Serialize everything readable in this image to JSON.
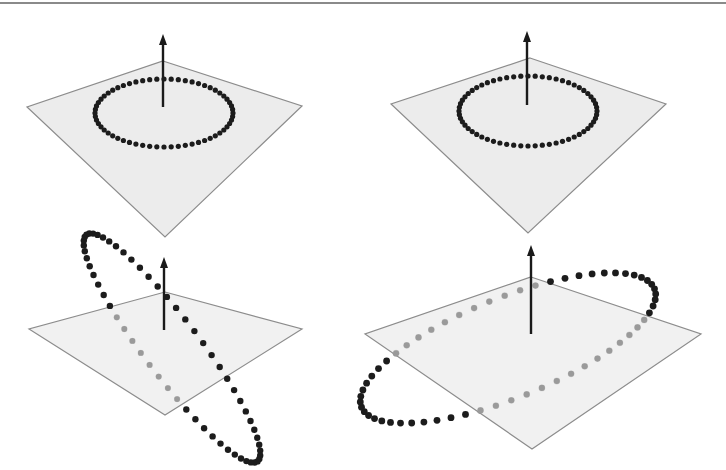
{
  "figure": {
    "colors": {
      "background": "#ffffff",
      "plane_fill": "#ececec",
      "plane_edge": "#8c8c8c",
      "arrow": "#1a1a1a",
      "dot_above": "#1c1c1c",
      "dot_below": "#9a9a9a"
    },
    "panels": [
      {
        "id": "top-left",
        "plane": [
          [
            163,
            61
          ],
          [
            302,
            106
          ],
          [
            165,
            237
          ],
          [
            27,
            107
          ]
        ],
        "arrow": {
          "from": [
            163,
            107
          ],
          "to": [
            163,
            34
          ]
        },
        "ring": {
          "cx": 164,
          "cy": 113,
          "rx": 69,
          "ry": 34,
          "tilt": 0,
          "count": 60,
          "dot_r": 2.6,
          "mode": "flat"
        }
      },
      {
        "id": "top-right",
        "plane": [
          [
            530,
            58
          ],
          [
            666,
            104
          ],
          [
            528,
            233
          ],
          [
            391,
            104
          ]
        ],
        "arrow": {
          "from": [
            527,
            105
          ],
          "to": [
            527,
            31
          ]
        },
        "ring": {
          "cx": 528,
          "cy": 111,
          "rx": 69,
          "ry": 35,
          "tilt": 0,
          "count": 60,
          "dot_r": 2.6,
          "mode": "flat"
        }
      },
      {
        "id": "bottom-left",
        "plane": [
          [
            165,
            292
          ],
          [
            302,
            329
          ],
          [
            165,
            415
          ],
          [
            29,
            329
          ]
        ],
        "arrow": {
          "from": [
            164,
            330
          ],
          "to": [
            164,
            257
          ]
        },
        "ring": {
          "mode": "tilted-vertical",
          "count": 60,
          "dot_r": 3.2
        }
      },
      {
        "id": "bottom-right",
        "plane": [
          [
            531,
            277
          ],
          [
            701,
            334
          ],
          [
            532,
            449
          ],
          [
            365,
            334
          ]
        ],
        "arrow": {
          "from": [
            531,
            334
          ],
          "to": [
            531,
            245
          ]
        },
        "ring": {
          "mode": "tilted-wide",
          "count": 60,
          "dot_r": 3.4
        }
      }
    ]
  }
}
